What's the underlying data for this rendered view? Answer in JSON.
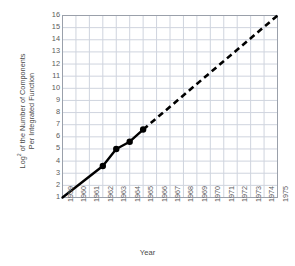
{
  "chart_data": {
    "type": "line",
    "title": "",
    "xlabel": "Year",
    "ylabel_line1": "of the Number of Components",
    "ylabel_line2": "Per Integrated Function",
    "ylabel_prefix": "Log",
    "ylabel_superscript": "2",
    "ylabel_full": "Log2 of the Number of Components Per Integrated Function",
    "xlim": [
      1959,
      1975
    ],
    "ylim": [
      1,
      16
    ],
    "grid": true,
    "legend": "none",
    "xticks": [
      "1959",
      "1960",
      "1961",
      "1962",
      "1963",
      "1964",
      "1965",
      "1966",
      "1967",
      "1968",
      "1969",
      "1970",
      "1971",
      "1972",
      "1973",
      "1974",
      "1975"
    ],
    "yticks": [
      "1",
      "2",
      "3",
      "4",
      "5",
      "6",
      "7",
      "8",
      "9",
      "10",
      "11",
      "12",
      "13",
      "14",
      "15",
      "16"
    ],
    "series": [
      {
        "name": "Observed",
        "style": "solid",
        "x": [
          1959,
          1962,
          1963,
          1964,
          1965
        ],
        "values": [
          1.0,
          3.6,
          5.0,
          5.6,
          6.6
        ]
      },
      {
        "name": "Extrapolation",
        "style": "dashed",
        "x": [
          1965,
          1975
        ],
        "values": [
          6.6,
          16.0
        ]
      }
    ],
    "markers": {
      "x": [
        1962,
        1963,
        1964,
        1965
      ],
      "values": [
        3.6,
        5.0,
        5.6,
        6.6
      ],
      "shape": "circle",
      "color": "#000000"
    },
    "colors": {
      "line": "#000000",
      "grid": "#cfd4de",
      "axis": "#9aa0aa",
      "text": "#4a4a4a",
      "background": "#ffffff"
    }
  }
}
